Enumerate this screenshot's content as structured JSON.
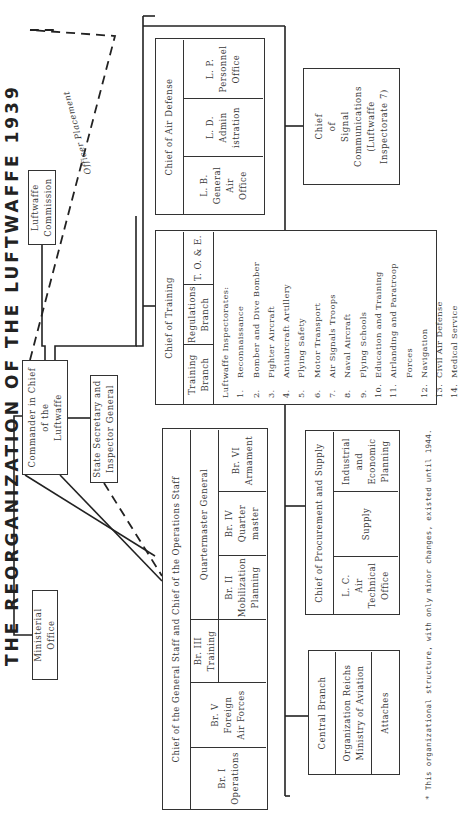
{
  "title": "THE REORGANIZATION OF THE LUFTWAFFE 1939",
  "footnote": "* This organizational structure, with only minor changes, existed until 1944.",
  "line_labels": {
    "officer_placement": "Officer Placement"
  },
  "boxes": {
    "ministerial_office": "Ministerial\nOffice",
    "commander_in_chief": "Commander in Chief\nof the\nLuftwaffe",
    "luftwaffe_commission": "Luftwaffe\nCommission",
    "state_secretary": "State Secretary and\nInspector General",
    "signal_communications": "Chief\nof\nSignal\nCommunications\n(Luftwaffe\nInspectorate 7)"
  },
  "air_defense": {
    "title": "Chief of Air Defense",
    "cells": [
      "L. B.\nGeneral\nAir\nOffice",
      "L. D.\nAdmin\nistration",
      "L. P.\nPersonnel\nOffice"
    ]
  },
  "training": {
    "title": "Chief of Training",
    "cells": [
      "Training\nBranch",
      "Regulations\nBranch",
      "T. O. & E."
    ],
    "inspectorates_heading": "Luftwaffe Inspectorates:",
    "inspectorates": [
      {
        "num": "1.",
        "name": "Reconnaissance"
      },
      {
        "num": "2.",
        "name": "Bomber and Dive Bomber"
      },
      {
        "num": "3.",
        "name": "Fighter Aircraft"
      },
      {
        "num": "4.",
        "name": "Antiaircraft Artillery"
      },
      {
        "num": "5.",
        "name": "Flying Safety"
      },
      {
        "num": "6.",
        "name": "Motor Transport"
      },
      {
        "num": "7.",
        "name": "Air Signals Troops"
      },
      {
        "num": "8.",
        "name": "Naval Aircraft"
      },
      {
        "num": "9.",
        "name": "Flying Schools"
      },
      {
        "num": "10.",
        "name": "Education and Training"
      },
      {
        "num": "11.",
        "name": "Airlanding and Paratroop\nForces"
      },
      {
        "num": "12.",
        "name": "Navigation"
      },
      {
        "num": "13.",
        "name": "Civil Air Defense"
      },
      {
        "num": "14.",
        "name": "Medical Service"
      }
    ]
  },
  "general_staff": {
    "title": "Chief of the General Staff and Chief of the Operations Staff",
    "branches": [
      "Br. I\nOperations",
      "Br. V\nForeign\nAir Forces",
      "Br. III\nTraining"
    ],
    "quartermaster": {
      "title": "Quartermaster General",
      "branches": [
        "Br. II\nMobilization\nPlanning",
        "Br. IV\nQuarter\nmaster",
        "Br. VI\nArmament"
      ]
    }
  },
  "procurement": {
    "title": "Chief of Procurement and Supply",
    "cells": [
      "L. C.\nAir\nTechnical\nOffice",
      "Supply",
      "Industrial\nand\nEconomic\nPlanning"
    ]
  },
  "central_branch": {
    "title": "Central Branch",
    "rows": [
      "Organization Reichs\nMinistry of Aviation",
      "Attaches"
    ]
  }
}
